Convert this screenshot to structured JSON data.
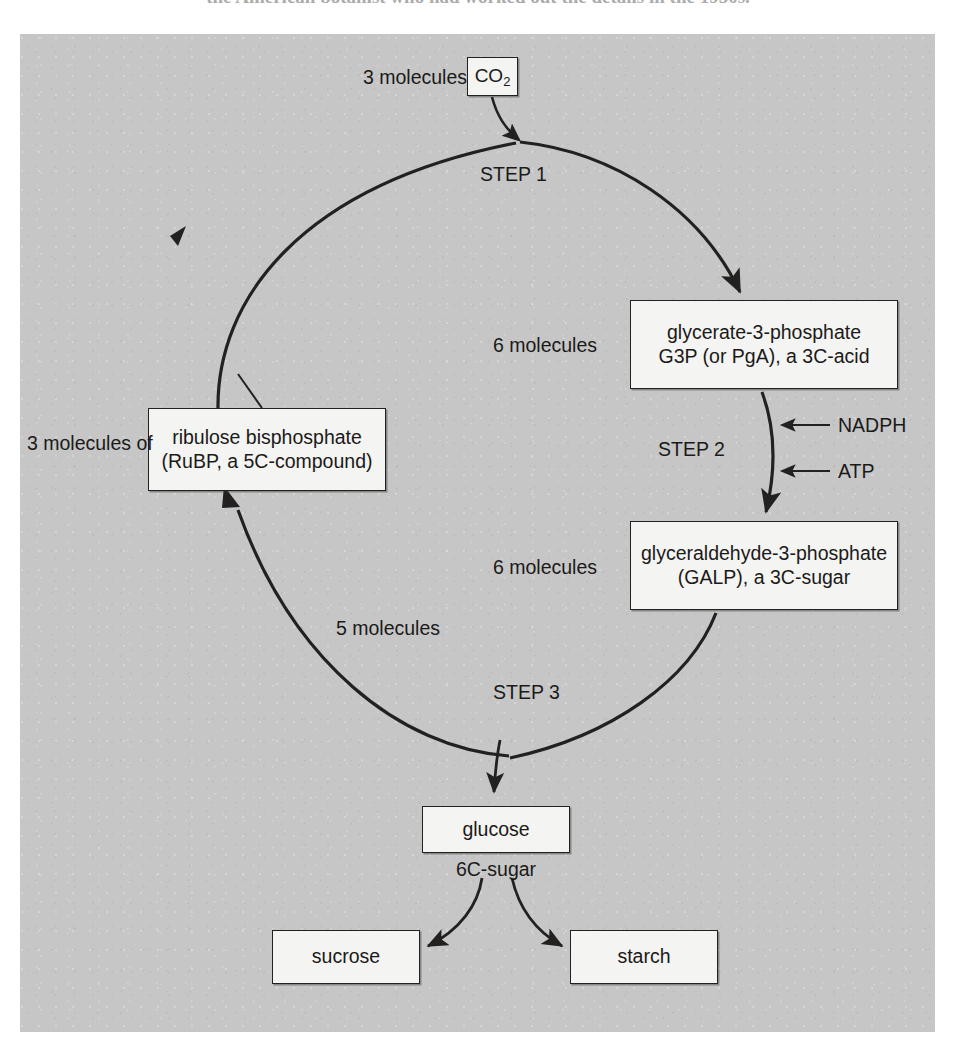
{
  "page": {
    "top_caption": "the American botanist who had worked out the details in the 1950s."
  },
  "diagram": {
    "background_color": "#c6c6c6",
    "box_fill": "#f4f4f2",
    "line_color": "#23211f",
    "nodes": [
      {
        "id": "co2",
        "label_lines": [
          "CO",
          "2"
        ],
        "count_label": "3 molecules"
      },
      {
        "id": "g3p",
        "label_lines": [
          "glycerate-3-phosphate",
          "G3P (or PgA), a 3C-acid"
        ],
        "count_label": "6 molecules"
      },
      {
        "id": "galp",
        "label_lines": [
          "glyceraldehyde-3-phosphate",
          "(GALP), a 3C-sugar"
        ],
        "count_label": "6 molecules"
      },
      {
        "id": "rubp",
        "label_lines": [
          "ribulose bisphosphate",
          "(RuBP, a 5C-compound)"
        ],
        "count_label": "3 molecules of"
      },
      {
        "id": "glucose",
        "label_lines": [
          "glucose"
        ],
        "count_label": "6C-sugar"
      },
      {
        "id": "sucrose",
        "label_lines": [
          "sucrose"
        ],
        "count_label": ""
      },
      {
        "id": "starch",
        "label_lines": [
          "starch"
        ],
        "count_label": ""
      }
    ],
    "labels": {
      "co2_count": "3 molecules",
      "co2_formula": "CO",
      "co2_subscript": "2",
      "step1": "STEP 1",
      "step2": "STEP 2",
      "step3": "STEP 3",
      "g3p_count": "6 molecules",
      "g3p_line1": "glycerate-3-phosphate",
      "g3p_line2": "G3P (or PgA), a 3C-acid",
      "nadph": "NADPH",
      "atp": "ATP",
      "galp_count": "6 molecules",
      "galp_line1": "glyceraldehyde-3-phosphate",
      "galp_line2": "(GALP), a 3C-sugar",
      "rubp_count": "3 molecules of",
      "rubp_line1": "ribulose bisphosphate",
      "rubp_line2": "(RuBP, a 5C-compound)",
      "five_molecules": "5 molecules",
      "glucose": "glucose",
      "six_c_sugar": "6C-sugar",
      "sucrose": "sucrose",
      "starch": "starch"
    }
  }
}
